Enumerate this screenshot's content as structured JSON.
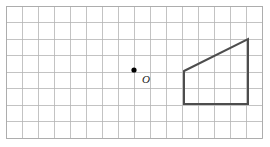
{
  "figure": {
    "canvas": {
      "width": 270,
      "height": 147,
      "background_color": "#ffffff"
    },
    "grid": {
      "name": "square-grid",
      "x_start": 6,
      "y_start": 6,
      "columns": 16,
      "rows": 8,
      "cell_width": 16,
      "cell_height": 16.5,
      "line_color": "#b4b4b4",
      "border_color": "#a8a8a8",
      "line_width": 0.8,
      "visible": true
    },
    "origin_point": {
      "name": "origin-point",
      "label": "O",
      "x": 134,
      "y": 70,
      "grid_col": 8,
      "grid_row": 4,
      "dot_radius": 2.6,
      "dot_color": "#000000",
      "label_x": 142,
      "label_y": 83,
      "label_color": "#1a1a1a"
    },
    "shape": {
      "name": "trapezoid",
      "type": "right trapezoid",
      "stroke_color": "#4d4d4d",
      "stroke_width": 2,
      "fill": "none",
      "points": "184,71 248,39 248,104 184,104",
      "vertices": [
        {
          "label": "top-left",
          "x": 184,
          "y": 71
        },
        {
          "label": "top-right",
          "x": 248,
          "y": 39
        },
        {
          "label": "bottom-right",
          "x": 248,
          "y": 104
        },
        {
          "label": "bottom-left",
          "x": 184,
          "y": 104
        }
      ]
    }
  }
}
